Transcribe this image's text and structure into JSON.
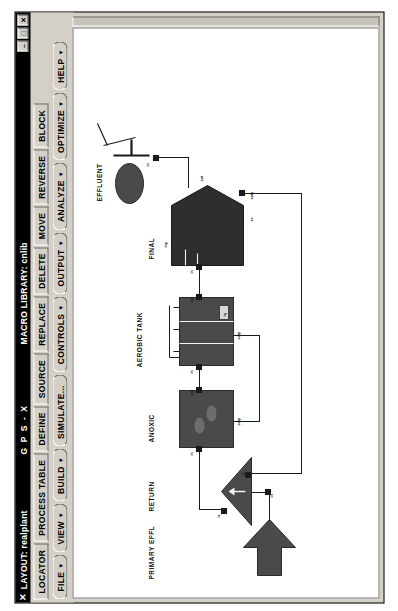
{
  "window": {
    "close_glyph": "✕",
    "layout_title": "LAYOUT: realplant",
    "app_title": "G P S - X",
    "macro_library": "MACRO LIBRARY: cnlib",
    "buttons": {
      "minimize": "–",
      "maximize": "□",
      "close": "✕"
    }
  },
  "toolbar_row1": [
    {
      "label": "LOCATOR"
    },
    {
      "label": "PROCESS TABLE"
    },
    {
      "label": "DEFINE"
    },
    {
      "label": "SOURCE"
    },
    {
      "label": "REPLACE"
    },
    {
      "label": "DELETE"
    },
    {
      "label": "MOVE"
    },
    {
      "label": "REVERSE"
    },
    {
      "label": "BLOCK"
    }
  ],
  "toolbar_row2": [
    {
      "label": "FILE",
      "caret": "▼"
    },
    {
      "label": "VIEW",
      "caret": "▼"
    },
    {
      "label": "BUILD",
      "caret": "▼"
    },
    {
      "label": "SIMULATE...",
      "caret": ""
    },
    {
      "label": "CONTROLS",
      "caret": "▼"
    },
    {
      "label": "OUTPUT",
      "caret": "▼"
    },
    {
      "label": "ANALYZE",
      "caret": "▼"
    },
    {
      "label": "OPTIMIZE",
      "caret": "▼"
    },
    {
      "label": "HELP",
      "caret": "▼"
    }
  ],
  "diagram": {
    "unit_labels": [
      {
        "name": "primary-effluent",
        "text": "PRIMARY EFFL"
      },
      {
        "name": "return",
        "text": "RETURN"
      },
      {
        "name": "anoxic",
        "text": "ANOXIC"
      },
      {
        "name": "aerobic-tank",
        "text": "AEROBIC TANK"
      },
      {
        "name": "final",
        "text": "FINAL"
      },
      {
        "name": "effluent",
        "text": "EFFLUENT"
      }
    ],
    "port_labels": [
      {
        "name": "return-in-port",
        "text": "in"
      },
      {
        "name": "return-out1-port",
        "text": "ix"
      },
      {
        "name": "return-out2-port",
        "text": "is"
      },
      {
        "name": "anoxic-in-port",
        "text": "in"
      },
      {
        "name": "anoxic-out-port",
        "text": "out"
      },
      {
        "name": "anoxic-outp-port",
        "text": "outp"
      },
      {
        "name": "aerobic-in-port",
        "text": "in"
      },
      {
        "name": "aerobic-out-port",
        "text": "out"
      },
      {
        "name": "aerobic-outp-port",
        "text": "outp"
      },
      {
        "name": "aerobic-iq-port",
        "text": "iq"
      },
      {
        "name": "final-in-port",
        "text": "in"
      },
      {
        "name": "final-inp-port",
        "text": "inp"
      },
      {
        "name": "final-out-port",
        "text": "out"
      },
      {
        "name": "final-outp-port",
        "text": "outp"
      },
      {
        "name": "final-ss-port",
        "text": "ss"
      },
      {
        "name": "effluent-in-port",
        "text": "in"
      }
    ],
    "colors": {
      "block_fill": "#4a4a4a",
      "line": "#1a1a1a",
      "canvas_bg": "#ffffff"
    }
  }
}
